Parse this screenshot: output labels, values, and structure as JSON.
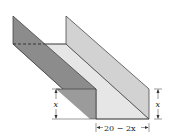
{
  "diagram": {
    "labels": {
      "left_height": "x",
      "right_height": "x",
      "base_width": "20 − 2x"
    },
    "colors": {
      "left_wall": "#8f8f8f",
      "left_wall_front": "#a6a6a6",
      "floor": "#e6e6e6",
      "right_wall": "#cfcfcf",
      "outline": "#333333",
      "background": "#ffffff"
    }
  }
}
